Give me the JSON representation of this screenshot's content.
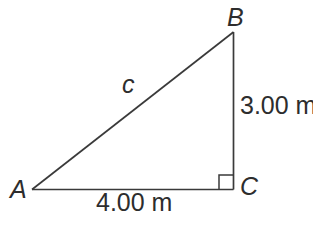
{
  "figure": {
    "type": "right-triangle-diagram",
    "background": "#ffffff",
    "line_color": "#3a3a3a",
    "text_color": "#2d2d2d",
    "vertices": [
      {
        "id": "A",
        "label": "A"
      },
      {
        "id": "B",
        "label": "B"
      },
      {
        "id": "C",
        "label": "C"
      }
    ],
    "sides": [
      {
        "between": "A-B",
        "label": "c"
      },
      {
        "between": "B-C",
        "label": "3.00 m"
      },
      {
        "between": "A-C",
        "label": "4.00 m"
      }
    ],
    "right_angle_at": "C"
  }
}
